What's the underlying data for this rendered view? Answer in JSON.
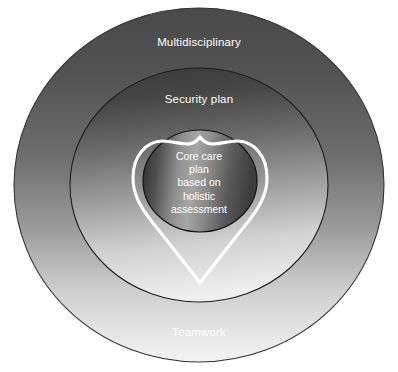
{
  "diagram": {
    "title": "Core care plan based on holistic assessment",
    "type": "concentric-circles-with-heart",
    "rings": [
      {
        "id": "outer",
        "label_top": "Multidisciplinary",
        "label_bottom": "Teamwork",
        "fill_from": "#4f4f4f",
        "fill_to": "#f2f2f2",
        "stroke": "#2b2b2b"
      },
      {
        "id": "middle",
        "label": "Security plan",
        "fill_from": "#3f3f3f",
        "fill_to": "#ededed",
        "stroke": "#1f1f1f"
      },
      {
        "id": "inner",
        "fill_from": "#2e2e2e",
        "fill_to": "#5a5a5a",
        "stroke": "#141414"
      }
    ],
    "core_text_lines": [
      "Core care",
      "plan",
      "based on",
      "holistic",
      "assessment"
    ],
    "heart": {
      "stroke": "#ffffff",
      "fill": "none",
      "stroke_width": 3
    },
    "text_color": "#ffffff"
  }
}
